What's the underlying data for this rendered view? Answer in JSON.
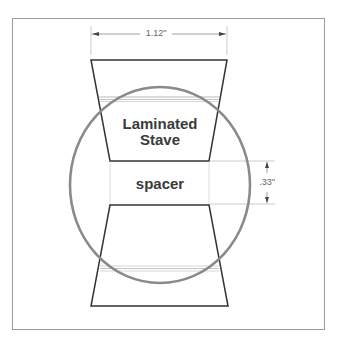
{
  "diagram": {
    "labels": {
      "stave": [
        "Laminated",
        "Stave"
      ],
      "spacer": "spacer",
      "width_dimension": "1.12\"",
      "height_dimension": ".33\""
    },
    "colors": {
      "outline": "#333333",
      "circle": "#8a8a8a",
      "frame": "#9a9a9a",
      "dimension": "#888888"
    }
  }
}
